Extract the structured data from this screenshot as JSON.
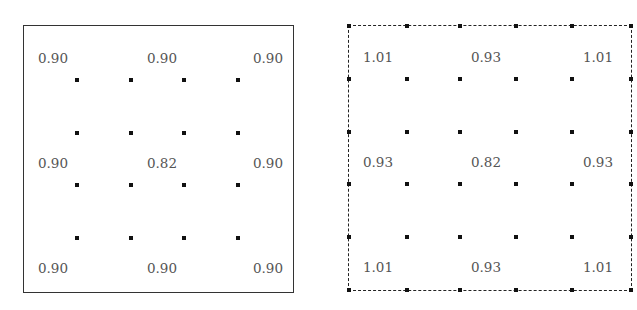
{
  "panels": [
    {
      "id": "left",
      "border": "solid",
      "labels": [
        [
          "0.90",
          "0.90",
          "0.90"
        ],
        [
          "0.90",
          "0.82",
          "0.90"
        ],
        [
          "0.90",
          "0.90",
          "0.90"
        ]
      ]
    },
    {
      "id": "right",
      "border": "dashed",
      "labels": [
        [
          "1.01",
          "0.93",
          "1.01"
        ],
        [
          "0.93",
          "0.82",
          "0.93"
        ],
        [
          "1.01",
          "0.93",
          "1.01"
        ]
      ]
    }
  ],
  "chart_data": {
    "type": "heatmap",
    "title": "",
    "grids": [
      {
        "name": "left (solid boundary)",
        "values": [
          [
            0.9,
            0.9,
            0.9
          ],
          [
            0.9,
            0.82,
            0.9
          ],
          [
            0.9,
            0.9,
            0.9
          ]
        ]
      },
      {
        "name": "right (dashed boundary)",
        "values": [
          [
            1.01,
            0.93,
            1.01
          ],
          [
            0.93,
            0.82,
            0.93
          ],
          [
            1.01,
            0.93,
            1.01
          ]
        ]
      }
    ],
    "dot_grid": "4x4 interior points per panel; right panel additionally has points on the boundary"
  }
}
